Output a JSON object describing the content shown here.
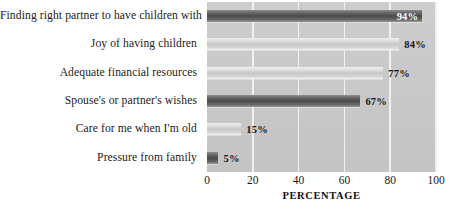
{
  "chart_data": {
    "type": "bar",
    "orientation": "horizontal",
    "title": "",
    "subtitle": "",
    "xlabel": "PERCENTAGE",
    "ylabel": "",
    "xlim": [
      0,
      100
    ],
    "xticks": [
      0,
      20,
      40,
      60,
      80,
      100
    ],
    "xtick_labels": [
      "0",
      "20",
      "40",
      "60",
      "80",
      "100"
    ],
    "grid": true,
    "grid_axis": "x",
    "legend": false,
    "categories": [
      "Finding right partner to have children with",
      "Joy of having children",
      "Adequate financial resources",
      "Spouse's or partner's wishes",
      "Care for me when I'm old",
      "Pressure from family"
    ],
    "values": [
      94,
      84,
      77,
      67,
      15,
      5
    ],
    "value_labels": [
      "94%",
      "84%",
      "77%",
      "67%",
      "15%",
      "5%"
    ],
    "label_positions": [
      "inside",
      "outside",
      "outside",
      "outside",
      "outside",
      "outside"
    ],
    "bar_styles": [
      "dark",
      "light",
      "light",
      "dark",
      "light",
      "dark"
    ],
    "colors": {
      "plot_background": "#c9c9c9",
      "gridline": "#f1f1f1",
      "bar_dark": "#4a4a4a",
      "bar_light": "#c6c6c6",
      "text": "#1b1b1b",
      "label_inside_text": "#ffffff",
      "page_background": "#ffffff"
    }
  }
}
